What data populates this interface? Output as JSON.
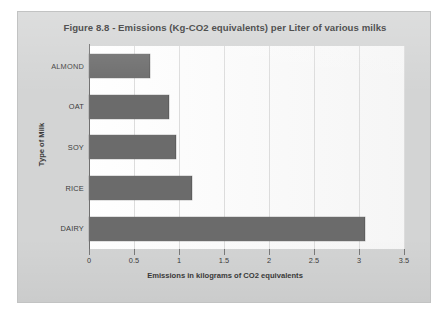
{
  "chart_data": {
    "type": "bar",
    "orientation": "horizontal",
    "title": "Figure 8.8 - Emissions (Kg-CO2 equivalents) per Liter of various milks",
    "xlabel": "Emissions in kilograms of CO2 equivalents",
    "ylabel": "Type of Milk",
    "categories": [
      "ALMOND",
      "OAT",
      "SOY",
      "RICE",
      "DAIRY"
    ],
    "values": [
      0.67,
      0.88,
      0.96,
      1.13,
      3.05
    ],
    "xlim": [
      0,
      3.5
    ],
    "xticks": [
      0,
      0.5,
      1,
      1.5,
      2,
      2.5,
      3,
      3.5
    ],
    "xtick_labels": [
      "0",
      "0.5",
      "1",
      "1.5",
      "2",
      "2.5",
      "3",
      "3.5"
    ],
    "grid": "vertical",
    "legend": "none",
    "bar_color": "#6b6b6b",
    "plot_background": "#fbfbfb",
    "panel_background": "#d3d4d4"
  }
}
